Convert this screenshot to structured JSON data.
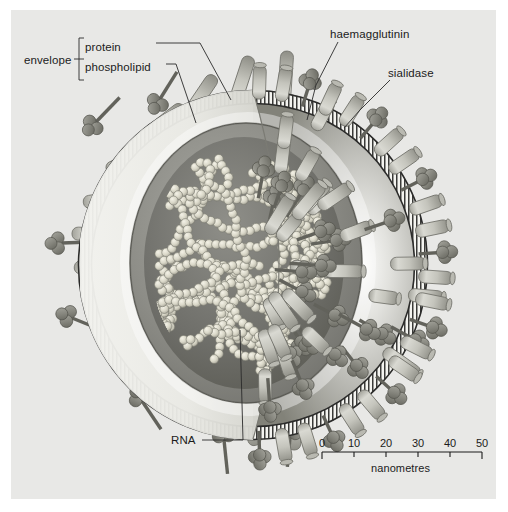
{
  "figure": {
    "background_color": "#e8e8e6",
    "page_color": "#ffffff",
    "text_color": "#1b1b1b"
  },
  "labels": {
    "envelope": "envelope",
    "protein": "protein",
    "phospholipid": "phospholipid",
    "haemagglutinin": "haemagglutinin",
    "sialidase": "sialidase",
    "rna": "RNA"
  },
  "scale_bar": {
    "unit_label": "nanometres",
    "ticks": [
      "0",
      "10",
      "20",
      "30",
      "40",
      "50"
    ],
    "x_start_px": 322,
    "x_end_px": 482,
    "y_px": 452
  },
  "chart_data": {
    "type": "diagram",
    "annotations": [
      {
        "label": "envelope",
        "target": "bracket grouping protein and phospholipid"
      },
      {
        "label": "protein",
        "target": "surface glycoprotein spike embedded in envelope"
      },
      {
        "label": "phospholipid",
        "target": "lipid bilayer membrane of envelope"
      },
      {
        "label": "haemagglutinin",
        "target": "rod-shaped spike on virion surface"
      },
      {
        "label": "sialidase",
        "target": "mushroom / knob-shaped spike on virion surface"
      },
      {
        "label": "RNA",
        "target": "beaded ribonucleoprotein strands inside core"
      }
    ],
    "scale": {
      "unit": "nanometres",
      "ticks": [
        0,
        10,
        20,
        30,
        40,
        50
      ],
      "bar_length_nm": 50
    },
    "components": {
      "spike_types": [
        "haemagglutinin (rod)",
        "sialidase (knob)"
      ],
      "envelope_layers": [
        "phospholipid bilayer",
        "matrix layer",
        "inner core"
      ],
      "genome": "segmented RNA shown as bead chains"
    },
    "colors": {
      "background": "#e8e8e6",
      "spike_light": "#c9c9c3",
      "spike_dark": "#8e8e88",
      "knob": "#8a8a84",
      "membrane": "#2c2c2c",
      "core_dark": "#6e6e6a",
      "core_mid": "#8c8c88",
      "rna_bead": "#d8d6c9"
    }
  }
}
